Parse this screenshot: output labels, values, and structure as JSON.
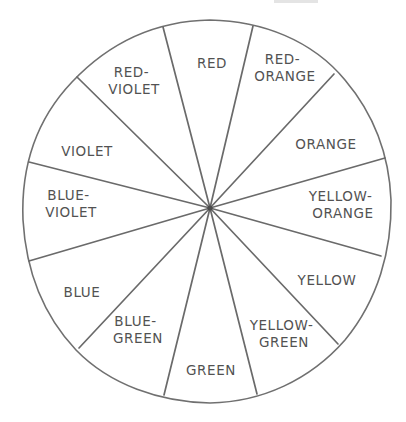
{
  "colors": {
    "stroke": "#6a6a6a",
    "text": "#525252",
    "background": "#ffffff"
  },
  "segments": [
    {
      "id": "red",
      "line1": "RED",
      "line2": "",
      "x": 212,
      "y": 64
    },
    {
      "id": "red-orange",
      "line1": "RED-",
      "line2": "ORANGE",
      "x": 285,
      "y": 72
    },
    {
      "id": "orange",
      "line1": "ORANGE",
      "line2": "",
      "x": 326,
      "y": 145
    },
    {
      "id": "yellow-orange",
      "line1": "YELLOW-",
      "line2": "ORANGE",
      "x": 343,
      "y": 209
    },
    {
      "id": "yellow",
      "line1": "YELLOW",
      "line2": "",
      "x": 327,
      "y": 281
    },
    {
      "id": "yellow-green",
      "line1": "YELLOW-",
      "line2": "GREEN",
      "x": 284,
      "y": 338
    },
    {
      "id": "green",
      "line1": "GREEN",
      "line2": "",
      "x": 211,
      "y": 371
    },
    {
      "id": "blue-green",
      "line1": "BLUE-",
      "line2": "GREEN",
      "x": 138,
      "y": 334
    },
    {
      "id": "blue",
      "line1": "BLUE",
      "line2": "",
      "x": 82,
      "y": 293
    },
    {
      "id": "blue-violet",
      "line1": "BLUE-",
      "line2": "VIOLET",
      "x": 71,
      "y": 208
    },
    {
      "id": "violet",
      "line1": "VIOLET",
      "line2": "",
      "x": 87,
      "y": 152
    },
    {
      "id": "red-violet",
      "line1": "RED-",
      "line2": "VIOLET",
      "x": 134,
      "y": 85
    }
  ],
  "spoke_endpoints": [
    [
      163,
      27
    ],
    [
      253,
      26
    ],
    [
      334,
      74
    ],
    [
      385,
      158
    ],
    [
      381,
      256
    ],
    [
      338,
      344
    ],
    [
      257,
      394
    ],
    [
      164,
      395
    ],
    [
      79,
      348
    ],
    [
      29,
      261
    ],
    [
      29,
      162
    ],
    [
      77,
      77
    ]
  ],
  "hub": {
    "x": 210,
    "y": 208
  }
}
